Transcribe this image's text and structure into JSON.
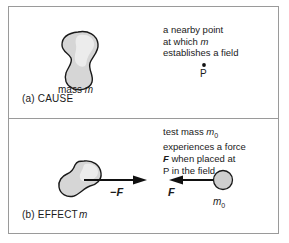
{
  "figure": {
    "panels": [
      {
        "id": "cause",
        "caption": "(a) CAUSE",
        "note_lines": [
          "a nearby point",
          "at which m",
          "establishes a field"
        ],
        "shape_label": "mass m",
        "point_label": "P"
      },
      {
        "id": "effect",
        "caption": "(b) EFFECT",
        "note_lines": [
          "test mass m0",
          "experiences a force",
          "F when placed at",
          "P in the field"
        ],
        "source_mass_label": "m",
        "test_mass_label": "m0",
        "force_on_source_label": "−F",
        "force_on_test_label": "F"
      }
    ],
    "text": {
      "cause_caption": "(a) CAUSE",
      "effect_caption": "(b) EFFECT",
      "mass_m": "mass ",
      "mass_m_italic": "m",
      "point_p": "P",
      "m_italic": "m",
      "m0_italic": "m",
      "m0_sub": "0",
      "minus_f": "−F",
      "f": "F",
      "cause_line1": "a nearby point",
      "cause_line2a": "at which ",
      "cause_line2b": "m",
      "cause_line3": "establishes a field",
      "effect_line1a": "test mass ",
      "effect_line1b": "m",
      "effect_line1c": "0",
      "effect_line2": "experiences a force",
      "effect_line3a": "F",
      "effect_line3b": " when placed at",
      "effect_line4": "P in the field"
    },
    "colors": {
      "background": "#ffffff",
      "border": "#9a9a9a",
      "blob_fill": "#d6d6d6",
      "blob_stroke": "#1a1a1a",
      "arrow": "#111111",
      "text": "#1a1a1a"
    }
  }
}
